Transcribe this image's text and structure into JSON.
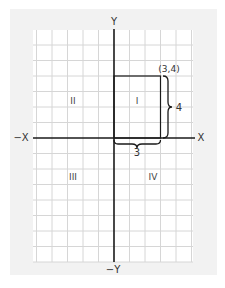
{
  "diagram": {
    "type": "cartesian-coordinate-plane",
    "axes": {
      "positive_x_label": "X",
      "negative_x_label": "−X",
      "positive_y_label": "Y",
      "negative_y_label": "−Y"
    },
    "quadrants": [
      {
        "id": "I",
        "label": "I"
      },
      {
        "id": "II",
        "label": "II"
      },
      {
        "id": "III",
        "label": "III"
      },
      {
        "id": "IV",
        "label": "IV"
      }
    ],
    "point": {
      "x": 3,
      "y": 4,
      "label": "(3,4)"
    },
    "rectangle": {
      "from": [
        0,
        0
      ],
      "to": [
        3,
        4
      ]
    },
    "dimensions": {
      "width_label": "3",
      "height_label": "4"
    },
    "grid": {
      "x_range": [
        -5,
        5
      ],
      "y_range": [
        -8,
        7
      ],
      "unit_px": 15.5
    },
    "colors": {
      "panel": "#f2f2f2",
      "grid_bg": "#ffffff",
      "grid_line": "#d6d6d6",
      "axis": "#1a1a1a",
      "text": "#333333"
    }
  }
}
